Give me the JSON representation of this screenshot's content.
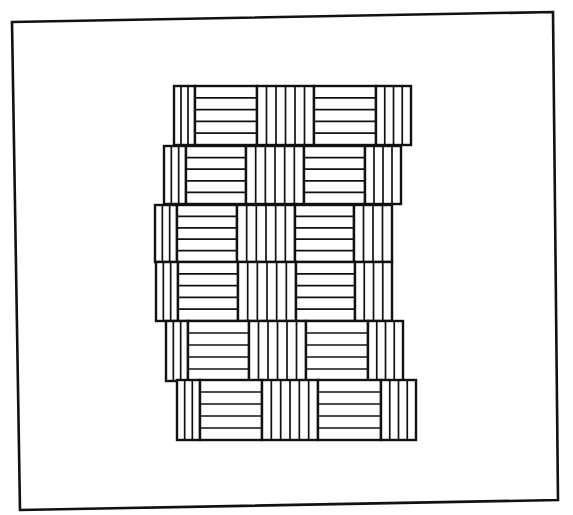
{
  "figure": {
    "stroke_color": "#111111",
    "background_color": "#ffffff",
    "frame": {
      "x1": 12,
      "y1": 22,
      "x2": 553,
      "y2": 12,
      "x3": 558,
      "y3": 500,
      "x4": 20,
      "y4": 510
    },
    "rows": [
      {
        "y_top": 86,
        "y_bottom": 145,
        "x_start": 174,
        "segments": [
          {
            "type": "v",
            "x0": 174,
            "x1": 195,
            "lines": 2
          },
          {
            "type": "h",
            "x0": 195,
            "x1": 257,
            "lines": 4
          },
          {
            "type": "v",
            "x0": 257,
            "x1": 314,
            "lines": 5
          },
          {
            "type": "h",
            "x0": 314,
            "x1": 376,
            "lines": 4
          },
          {
            "type": "v",
            "x0": 376,
            "x1": 411,
            "lines": 3
          }
        ]
      },
      {
        "y_top": 146,
        "y_bottom": 204,
        "x_start": 164,
        "segments": [
          {
            "type": "v",
            "x0": 164,
            "x1": 186,
            "lines": 2
          },
          {
            "type": "h",
            "x0": 186,
            "x1": 246,
            "lines": 4
          },
          {
            "type": "v",
            "x0": 246,
            "x1": 304,
            "lines": 5
          },
          {
            "type": "h",
            "x0": 304,
            "x1": 365,
            "lines": 4
          },
          {
            "type": "v",
            "x0": 365,
            "x1": 401,
            "lines": 3
          }
        ]
      },
      {
        "y_top": 205,
        "y_bottom": 262,
        "x_start": 155,
        "segments": [
          {
            "type": "v",
            "x0": 155,
            "x1": 177,
            "lines": 2
          },
          {
            "type": "h",
            "x0": 177,
            "x1": 237,
            "lines": 4
          },
          {
            "type": "v",
            "x0": 237,
            "x1": 295,
            "lines": 5
          },
          {
            "type": "h",
            "x0": 295,
            "x1": 354,
            "lines": 4
          },
          {
            "type": "v",
            "x0": 354,
            "x1": 392,
            "lines": 3
          }
        ]
      },
      {
        "y_top": 262,
        "y_bottom": 321,
        "x_start": 156,
        "segments": [
          {
            "type": "v",
            "x0": 156,
            "x1": 178,
            "lines": 2
          },
          {
            "type": "h",
            "x0": 178,
            "x1": 238,
            "lines": 4
          },
          {
            "type": "v",
            "x0": 238,
            "x1": 296,
            "lines": 5
          },
          {
            "type": "h",
            "x0": 296,
            "x1": 355,
            "lines": 4
          },
          {
            "type": "v",
            "x0": 355,
            "x1": 392,
            "lines": 3
          }
        ]
      },
      {
        "y_top": 321,
        "y_bottom": 381,
        "x_start": 166,
        "segments": [
          {
            "type": "v",
            "x0": 166,
            "x1": 188,
            "lines": 2
          },
          {
            "type": "h",
            "x0": 188,
            "x1": 249,
            "lines": 4
          },
          {
            "type": "v",
            "x0": 249,
            "x1": 306,
            "lines": 5
          },
          {
            "type": "h",
            "x0": 306,
            "x1": 368,
            "lines": 4
          },
          {
            "type": "v",
            "x0": 368,
            "x1": 403,
            "lines": 3
          }
        ]
      },
      {
        "y_top": 380,
        "y_bottom": 440,
        "x_start": 177,
        "segments": [
          {
            "type": "v",
            "x0": 177,
            "x1": 200,
            "lines": 2
          },
          {
            "type": "h",
            "x0": 200,
            "x1": 262,
            "lines": 4
          },
          {
            "type": "v",
            "x0": 262,
            "x1": 318,
            "lines": 5
          },
          {
            "type": "h",
            "x0": 318,
            "x1": 381,
            "lines": 4
          },
          {
            "type": "v",
            "x0": 381,
            "x1": 416,
            "lines": 3
          }
        ]
      }
    ]
  }
}
